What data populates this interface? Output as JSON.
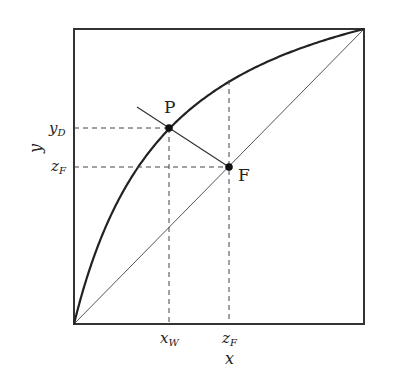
{
  "diagram": {
    "type": "mccabe-thiele-xy",
    "frame": {
      "x0": 74,
      "y0": 29,
      "x1": 364,
      "y1": 324
    },
    "relative_volatility": 4.0,
    "x_axis_label": "x",
    "y_axis_label": "y",
    "points": {
      "P": {
        "label": "P",
        "x": 0.328,
        "y": 0.661
      },
      "F": {
        "label": "F",
        "x": 0.534,
        "y": 0.534
      }
    },
    "tick_labels": {
      "x_w": {
        "main": "x",
        "sub": "W"
      },
      "z_f_x": {
        "main": "z",
        "sub": "F"
      },
      "y_d": {
        "main": "y",
        "sub": "D"
      },
      "z_f_y": {
        "main": "z",
        "sub": "F"
      }
    },
    "operating_line": {
      "x_start": 0.217,
      "y_start": 0.732,
      "x_end": 0.534,
      "y_end": 0.534
    },
    "colors": {
      "frame": "#333333",
      "curve": "#222222",
      "diagonal": "#555555",
      "dashed": "#444444",
      "points": "#111111"
    }
  }
}
